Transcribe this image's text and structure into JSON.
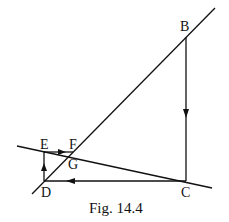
{
  "figure": {
    "caption": "Fig. 14.4",
    "points": {
      "B": "B",
      "C": "C",
      "D": "D",
      "E": "E",
      "F": "F",
      "G": "G"
    },
    "colors": {
      "stroke": "#111111",
      "background": "#ffffff"
    }
  }
}
